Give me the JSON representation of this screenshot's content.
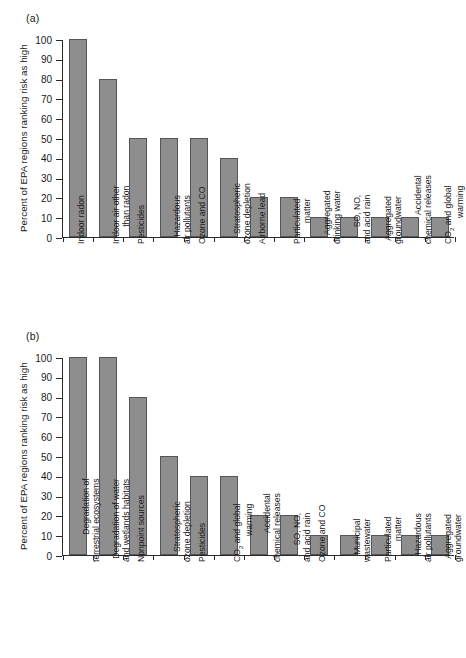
{
  "figure": {
    "panels": [
      {
        "tag": "(a)",
        "ylabel": "Percent of EPA regions ranking risk as high"
      },
      {
        "tag": "(b)",
        "ylabel": "Percent of EPA regions ranking risk as high"
      }
    ]
  },
  "chart_data": [
    {
      "type": "bar",
      "title": "(a)",
      "xlabel": "",
      "ylabel": "Percent of EPA regions ranking risk as high",
      "ylim": [
        0,
        100
      ],
      "yticks": [
        0,
        10,
        20,
        30,
        40,
        50,
        60,
        70,
        80,
        90,
        100
      ],
      "grid": false,
      "legend": false,
      "bar_color": "#8e8e8e",
      "bar_edge_color": "#555555",
      "categories": [
        "Indoor radon",
        "Indoor air other than radon",
        "Pesticides",
        "Hazardous air pollutants",
        "Ozone and CO",
        "Stratospheric ozone depletion",
        "Airborne lead",
        "Particulated matter",
        "Aggregated drinking water",
        "SO, NO, and acid rain",
        "Aggregated groundwater",
        "Accidental chemical releases",
        "CO2 and global warming"
      ],
      "category_lines": [
        [
          "Indoor radon"
        ],
        [
          "Indoor air other",
          "than radon"
        ],
        [
          "Pesticides"
        ],
        [
          "Hazardous",
          "air pollutants"
        ],
        [
          "Ozone and CO"
        ],
        [
          "Stratospheric",
          "ozone depletion"
        ],
        [
          "Airborne lead"
        ],
        [
          "Particulated",
          "matter"
        ],
        [
          "Aggregated",
          "drinking water"
        ],
        [
          "SO, NO,",
          "and acid rain"
        ],
        [
          "Aggregated",
          "groundwater"
        ],
        [
          "Accidental",
          "chemical releases"
        ],
        [
          "CO2 and global",
          "warming"
        ]
      ],
      "values": [
        100,
        80,
        50,
        50,
        50,
        40,
        20,
        20,
        10,
        10,
        10,
        10,
        10
      ]
    },
    {
      "type": "bar",
      "title": "(b)",
      "xlabel": "",
      "ylabel": "Percent of EPA regions ranking risk as high",
      "ylim": [
        0,
        100
      ],
      "yticks": [
        0,
        10,
        20,
        30,
        40,
        50,
        60,
        70,
        80,
        90,
        100
      ],
      "grid": false,
      "legend": false,
      "bar_color": "#8e8e8e",
      "bar_edge_color": "#555555",
      "categories": [
        "Degradation of terrestrial ecosystems",
        "Degradation of water and wetlands habitats",
        "Nonpoint sources",
        "Stratospheric ozone depletion",
        "Pesticides",
        "CO2 and global warming",
        "Accidental chemical releases",
        "SO, NO, and acid rain",
        "Ozone and CO",
        "Municipal wastewater",
        "Particulated matter",
        "Hazardous air pollutants",
        "Aggregated groundwater"
      ],
      "category_lines": [
        [
          "Degradation of",
          "terrestrial ecosystems"
        ],
        [
          "Degradation of water",
          "and wetlands habitats"
        ],
        [
          "Nonpoint sources"
        ],
        [
          "Stratospheric",
          "ozone depletion"
        ],
        [
          "Pesticides"
        ],
        [
          "CO2 and global",
          "warming"
        ],
        [
          "Accidental",
          "chemical releases"
        ],
        [
          "SO, NO,",
          "and acid rain"
        ],
        [
          "Ozone and CO"
        ],
        [
          "Municipal",
          "wastewater"
        ],
        [
          "Particulated",
          "matter"
        ],
        [
          "Hazardous",
          "air pollutants"
        ],
        [
          "Aggregated",
          "groundwater"
        ]
      ],
      "values": [
        100,
        100,
        80,
        50,
        40,
        40,
        20,
        20,
        10,
        10,
        10,
        10,
        10
      ]
    }
  ]
}
